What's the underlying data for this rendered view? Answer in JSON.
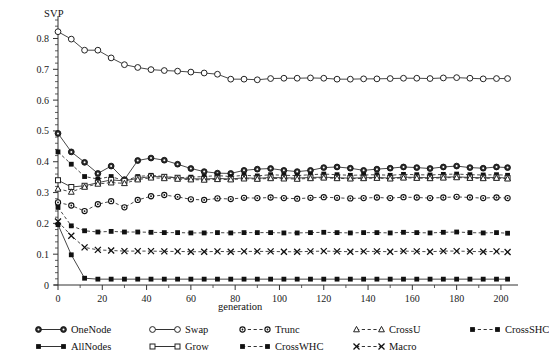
{
  "chart_data": {
    "type": "line",
    "title": "",
    "ylabel": "SVP",
    "xlabel": "generation",
    "xlim": [
      0,
      205
    ],
    "ylim": [
      0,
      0.86
    ],
    "xticks": [
      0,
      20,
      40,
      60,
      80,
      100,
      120,
      140,
      160,
      180,
      200
    ],
    "yticks": [
      0,
      0.1,
      0.2,
      0.3,
      0.4,
      0.5,
      0.6,
      0.7,
      0.8
    ],
    "ytick_labels": [
      "0",
      "0.1",
      "0.2",
      "0.3",
      "0.4",
      "0.5",
      "0.6",
      "0.7",
      "0.8"
    ],
    "xtick_labels": [
      "0",
      "20",
      "40",
      "60",
      "80",
      "100",
      "120",
      "140",
      "160",
      "180",
      "200"
    ],
    "minor_ticks_y": true,
    "grid": false,
    "legend_position": "bottom",
    "x": [
      0,
      6,
      12,
      18,
      24,
      30,
      36,
      42,
      48,
      54,
      60,
      66,
      72,
      78,
      84,
      90,
      96,
      102,
      108,
      114,
      120,
      126,
      132,
      138,
      144,
      150,
      156,
      162,
      168,
      174,
      180,
      186,
      192,
      198,
      203
    ],
    "series": [
      {
        "name": "Swap",
        "marker": "open-circle",
        "line": "solid",
        "values": [
          0.822,
          0.798,
          0.762,
          0.762,
          0.737,
          0.715,
          0.706,
          0.699,
          0.696,
          0.694,
          0.691,
          0.688,
          0.684,
          0.668,
          0.668,
          0.666,
          0.67,
          0.671,
          0.671,
          0.672,
          0.671,
          0.668,
          0.668,
          0.669,
          0.669,
          0.67,
          0.671,
          0.671,
          0.67,
          0.672,
          0.673,
          0.671,
          0.669,
          0.67,
          0.67
        ]
      },
      {
        "name": "OneNode",
        "marker": "filled-circle",
        "line": "solid",
        "values": [
          0.492,
          0.432,
          0.398,
          0.362,
          0.386,
          0.342,
          0.404,
          0.412,
          0.405,
          0.392,
          0.378,
          0.368,
          0.363,
          0.362,
          0.372,
          0.376,
          0.378,
          0.372,
          0.368,
          0.372,
          0.381,
          0.383,
          0.379,
          0.372,
          0.376,
          0.379,
          0.383,
          0.381,
          0.378,
          0.383,
          0.386,
          0.381,
          0.379,
          0.383,
          0.381
        ]
      },
      {
        "name": "CrossSHC",
        "marker": "filled-square",
        "line": "dashed",
        "values": [
          0.432,
          0.392,
          0.352,
          0.344,
          0.352,
          0.338,
          0.352,
          0.356,
          0.352,
          0.348,
          0.35,
          0.352,
          0.355,
          0.352,
          0.356,
          0.354,
          0.358,
          0.356,
          0.355,
          0.358,
          0.36,
          0.358,
          0.356,
          0.357,
          0.358,
          0.356,
          0.359,
          0.358,
          0.357,
          0.359,
          0.36,
          0.358,
          0.357,
          0.358,
          0.356
        ]
      },
      {
        "name": "Grow",
        "marker": "open-square",
        "line": "solid",
        "values": [
          0.34,
          0.318,
          0.322,
          0.332,
          0.341,
          0.338,
          0.346,
          0.352,
          0.351,
          0.348,
          0.345,
          0.344,
          0.346,
          0.344,
          0.348,
          0.346,
          0.349,
          0.348,
          0.347,
          0.349,
          0.35,
          0.348,
          0.347,
          0.348,
          0.349,
          0.347,
          0.35,
          0.349,
          0.348,
          0.35,
          0.351,
          0.349,
          0.348,
          0.349,
          0.347
        ]
      },
      {
        "name": "CrossU",
        "marker": "open-triangle",
        "line": "dashed",
        "values": [
          0.312,
          0.302,
          0.318,
          0.328,
          0.332,
          0.33,
          0.342,
          0.348,
          0.346,
          0.344,
          0.342,
          0.341,
          0.343,
          0.342,
          0.345,
          0.344,
          0.346,
          0.345,
          0.344,
          0.346,
          0.348,
          0.346,
          0.345,
          0.346,
          0.347,
          0.345,
          0.348,
          0.347,
          0.346,
          0.348,
          0.349,
          0.347,
          0.346,
          0.347,
          0.345
        ]
      },
      {
        "name": "Trunc",
        "marker": "open-circle-small",
        "line": "dashed",
        "values": [
          0.268,
          0.258,
          0.24,
          0.262,
          0.272,
          0.252,
          0.276,
          0.288,
          0.292,
          0.286,
          0.278,
          0.276,
          0.281,
          0.279,
          0.283,
          0.282,
          0.284,
          0.282,
          0.28,
          0.283,
          0.285,
          0.283,
          0.281,
          0.282,
          0.284,
          0.282,
          0.285,
          0.284,
          0.282,
          0.284,
          0.286,
          0.284,
          0.282,
          0.284,
          0.282
        ]
      },
      {
        "name": "CrossWHC",
        "marker": "filled-square",
        "line": "dashed",
        "values": [
          0.252,
          0.192,
          0.176,
          0.172,
          0.174,
          0.172,
          0.172,
          0.171,
          0.17,
          0.17,
          0.169,
          0.169,
          0.17,
          0.169,
          0.17,
          0.17,
          0.17,
          0.169,
          0.169,
          0.17,
          0.171,
          0.17,
          0.169,
          0.17,
          0.17,
          0.169,
          0.171,
          0.17,
          0.169,
          0.171,
          0.172,
          0.17,
          0.169,
          0.17,
          0.168
        ]
      },
      {
        "name": "Macro",
        "marker": "x-mark",
        "line": "dashed",
        "values": [
          0.206,
          0.16,
          0.122,
          0.114,
          0.112,
          0.11,
          0.11,
          0.11,
          0.109,
          0.109,
          0.108,
          0.108,
          0.109,
          0.108,
          0.109,
          0.109,
          0.109,
          0.108,
          0.108,
          0.109,
          0.11,
          0.109,
          0.108,
          0.109,
          0.109,
          0.108,
          0.11,
          0.109,
          0.108,
          0.11,
          0.11,
          0.109,
          0.108,
          0.109,
          0.107
        ]
      },
      {
        "name": "AllNodes",
        "marker": "filled-square",
        "line": "solid",
        "values": [
          0.196,
          0.098,
          0.022,
          0.019,
          0.019,
          0.019,
          0.019,
          0.019,
          0.019,
          0.019,
          0.019,
          0.019,
          0.019,
          0.019,
          0.019,
          0.019,
          0.019,
          0.019,
          0.019,
          0.019,
          0.019,
          0.019,
          0.019,
          0.019,
          0.019,
          0.019,
          0.019,
          0.019,
          0.019,
          0.019,
          0.019,
          0.019,
          0.019,
          0.019,
          0.019
        ]
      }
    ]
  },
  "legend": {
    "rows": [
      [
        {
          "label": "OneNode",
          "marker": "filled-circle",
          "line": "solid"
        },
        {
          "label": "Swap",
          "marker": "open-circle",
          "line": "solid"
        },
        {
          "label": "Trunc",
          "marker": "open-circle-small",
          "line": "dashed"
        },
        {
          "label": "CrossU",
          "marker": "open-triangle",
          "line": "dashed"
        },
        {
          "label": "CrossSHC",
          "marker": "filled-square",
          "line": "dashed"
        }
      ],
      [
        {
          "label": "AllNodes",
          "marker": "filled-square",
          "line": "solid"
        },
        {
          "label": "Grow",
          "marker": "open-square",
          "line": "solid"
        },
        {
          "label": "CrossWHC",
          "marker": "filled-square",
          "line": "dashed"
        },
        {
          "label": "Macro",
          "marker": "x-mark",
          "line": "dashed"
        }
      ]
    ]
  },
  "colors": {
    "ink": "#1a1a1a",
    "axis": "#333333",
    "background": "#ffffff"
  }
}
